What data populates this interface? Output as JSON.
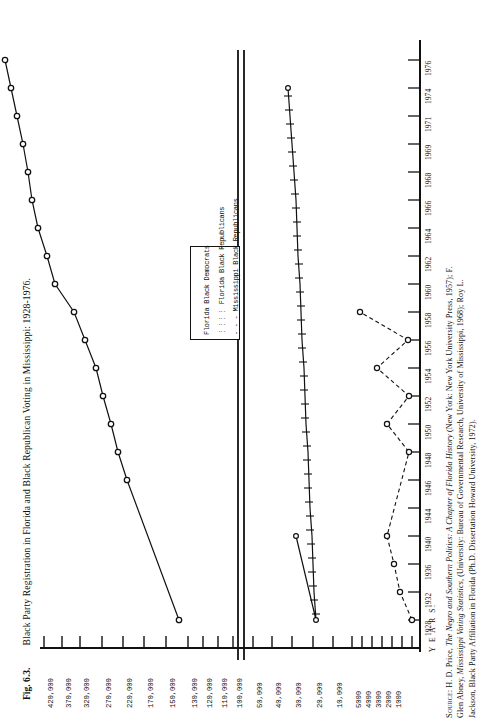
{
  "figure": {
    "number": "Fig. 6.3.",
    "title": "Black Party Registration in Florida and Black Republican Voting in Mississippi: 1928-1976."
  },
  "legend": {
    "items": [
      {
        "key": "fl-dem",
        "label": "Florida Black Democrats",
        "style": "solid-line-open-circle"
      },
      {
        "key": "fl-rep",
        "label": "Florida Black Republicans",
        "style": "solid-line-cross-tick"
      },
      {
        "key": "ms-rep",
        "label": "Mississippi Black Republicans",
        "style": "dashed-line-open-circle"
      }
    ]
  },
  "axes": {
    "value_axis_label": "",
    "year_axis_label": "Y E A R S:",
    "value_ticks": [
      "420,000",
      "370,000",
      "320,000",
      "270,000",
      "220,000",
      "170,000",
      "150,000",
      "130,000",
      "120,000",
      "110,000",
      "100,000",
      "50,000",
      "40,000",
      "30,000",
      "20,000",
      "10,000",
      "5000",
      "4000",
      "3000",
      "2000",
      "1000"
    ],
    "year_ticks": [
      "1928",
      "1932",
      "1936",
      "1940",
      "1944",
      "1946",
      "1948",
      "1950",
      "1952",
      "1954",
      "1956",
      "1958",
      "1960",
      "1962",
      "1964",
      "1966",
      "1968",
      "1969",
      "1971",
      "1974",
      "1976"
    ]
  },
  "source": {
    "lines": [
      "Source: H. D. Price, The Negro and Southern Politics: A Chapter of Florida History (New York: New York University Press, 1957); F.",
      "Glen Abney, Mississippi Voting Statistics, (University: Bureau of Governmental Research, University of Mississippi, 1968); Roy L.",
      "Jackson, Black Party Affiliation in Florida (Ph.D. Dissertation Howard University, 1972)."
    ],
    "label": "Source:"
  },
  "chart_data": {
    "type": "line",
    "title": "Black Party Registration in Florida and Black Republican Voting in Mississippi: 1928-1976",
    "xlabel": "YEARS",
    "ylabel": "Number of registrants / voters",
    "grid": false,
    "legend_position": "inner-left",
    "orientation": "rotated-90-axes-on-right",
    "x": [
      "1928",
      "1932",
      "1936",
      "1940",
      "1944",
      "1946",
      "1948",
      "1950",
      "1952",
      "1954",
      "1956",
      "1958",
      "1960",
      "1962",
      "1964",
      "1966",
      "1968",
      "1969",
      "1971",
      "1974",
      "1976"
    ],
    "ylim": [
      0,
      420000
    ],
    "ytick_values": [
      420000,
      370000,
      320000,
      270000,
      220000,
      170000,
      150000,
      130000,
      120000,
      110000,
      100000,
      50000,
      40000,
      30000,
      20000,
      10000,
      5000,
      4000,
      3000,
      2000,
      1000
    ],
    "series": [
      {
        "name": "Florida Black Democrats",
        "style": "solid",
        "marker": "open-circle",
        "points": [
          {
            "x": "1944",
            "y": 30000
          },
          {
            "x": "1946",
            "y": 100000
          },
          {
            "x": "1948",
            "y": 110000
          },
          {
            "x": "1950",
            "y": 115000
          },
          {
            "x": "1952",
            "y": 125000
          },
          {
            "x": "1954",
            "y": 132000
          },
          {
            "x": "1956",
            "y": 150000
          },
          {
            "x": "1958",
            "y": 170000
          },
          {
            "x": "1960",
            "y": 205000
          },
          {
            "x": "1962",
            "y": 225000
          },
          {
            "x": "1964",
            "y": 245000
          },
          {
            "x": "1966",
            "y": 260000
          },
          {
            "x": "1968",
            "y": 270000
          },
          {
            "x": "1969",
            "y": 290000
          },
          {
            "x": "1971",
            "y": 320000
          },
          {
            "x": "1974",
            "y": 370000
          },
          {
            "x": "1976",
            "y": 420000
          }
        ]
      },
      {
        "name": "Florida Black Republicans",
        "style": "solid-hatched",
        "marker": "cross-tick",
        "points": [
          {
            "x": "1940",
            "y": 18000
          },
          {
            "x": "1944",
            "y": 8000
          },
          {
            "x": "1946",
            "y": 9000
          },
          {
            "x": "1948",
            "y": 9500
          },
          {
            "x": "1950",
            "y": 10000
          },
          {
            "x": "1952",
            "y": 10500
          },
          {
            "x": "1954",
            "y": 11000
          },
          {
            "x": "1956",
            "y": 11500
          },
          {
            "x": "1958",
            "y": 12000
          },
          {
            "x": "1960",
            "y": 12500
          },
          {
            "x": "1962",
            "y": 13000
          },
          {
            "x": "1964",
            "y": 13500
          },
          {
            "x": "1966",
            "y": 14000
          },
          {
            "x": "1968",
            "y": 14500
          },
          {
            "x": "1969",
            "y": 15000
          },
          {
            "x": "1971",
            "y": 15500
          },
          {
            "x": "1974",
            "y": 16000
          },
          {
            "x": "1976",
            "y": 18000
          }
        ]
      },
      {
        "name": "Mississippi Black Republicans",
        "style": "dashed",
        "marker": "open-circle",
        "points": [
          {
            "x": "1928",
            "y": 1000
          },
          {
            "x": "1932",
            "y": 2000
          },
          {
            "x": "1936",
            "y": 2500
          },
          {
            "x": "1940",
            "y": 3000
          },
          {
            "x": "1946",
            "y": 1000
          },
          {
            "x": "1948",
            "y": 3000
          },
          {
            "x": "1950",
            "y": 1000
          },
          {
            "x": "1952",
            "y": 4000
          },
          {
            "x": "1954",
            "y": 1000
          },
          {
            "x": "1956",
            "y": 5000
          }
        ]
      }
    ]
  }
}
